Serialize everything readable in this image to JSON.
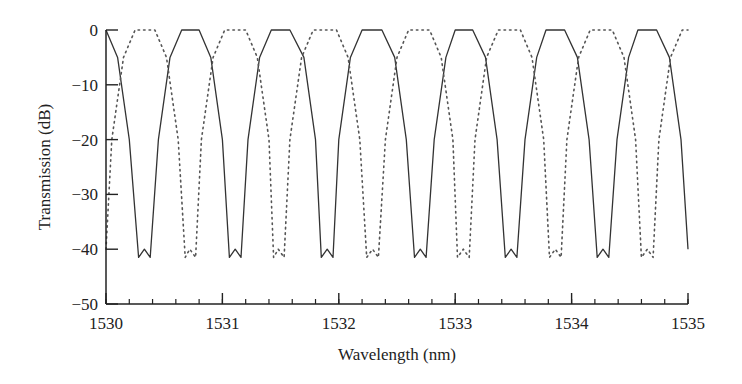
{
  "chart_data": {
    "type": "line",
    "title": "",
    "xlabel": "Wavelength (nm)",
    "ylabel": "Transmission (dB)",
    "xlim": [
      1530,
      1535
    ],
    "ylim": [
      -50,
      0
    ],
    "xticks": [
      1530,
      1531,
      1532,
      1533,
      1534,
      1535
    ],
    "xtick_labels": [
      "1530",
      "1531",
      "1532",
      "1533",
      "1534",
      "1535"
    ],
    "x_minor_step": 0.2,
    "yticks": [
      0,
      -10,
      -20,
      -30,
      -40,
      -50
    ],
    "ytick_labels": [
      "0",
      "−10",
      "−20",
      "−30",
      "−40",
      "−50"
    ],
    "grid": false,
    "legend": null,
    "period_nm": 0.785,
    "series": [
      {
        "name": "solid",
        "style": "solid",
        "color": "#333333",
        "peaks_nm": [
          1530.0,
          1530.73,
          1531.5,
          1532.29,
          1533.07,
          1533.86,
          1534.65
        ],
        "dips_nm": [
          1530.33,
          1531.11,
          1531.9,
          1532.7,
          1533.48,
          1534.27
        ],
        "peak_db": 0,
        "dip_db": -41.5,
        "points": [
          [
            1530.0,
            0
          ],
          [
            1530.1,
            -5
          ],
          [
            1530.2,
            -20
          ],
          [
            1530.28,
            -41.5
          ],
          [
            1530.33,
            -40
          ],
          [
            1530.38,
            -41.5
          ],
          [
            1530.45,
            -20
          ],
          [
            1530.55,
            -5
          ],
          [
            1530.65,
            0
          ],
          [
            1530.8,
            0
          ],
          [
            1530.9,
            -5
          ],
          [
            1531.0,
            -20
          ],
          [
            1531.06,
            -41.5
          ],
          [
            1531.11,
            -40
          ],
          [
            1531.16,
            -41.5
          ],
          [
            1531.22,
            -20
          ],
          [
            1531.32,
            -5
          ],
          [
            1531.42,
            0
          ],
          [
            1531.58,
            0
          ],
          [
            1531.7,
            -5
          ],
          [
            1531.8,
            -20
          ],
          [
            1531.85,
            -41.5
          ],
          [
            1531.9,
            -40
          ],
          [
            1531.95,
            -41.5
          ],
          [
            1532.0,
            -20
          ],
          [
            1532.1,
            -5
          ],
          [
            1532.2,
            0
          ],
          [
            1532.37,
            0
          ],
          [
            1532.48,
            -5
          ],
          [
            1532.58,
            -20
          ],
          [
            1532.65,
            -41.5
          ],
          [
            1532.7,
            -40
          ],
          [
            1532.75,
            -41.5
          ],
          [
            1532.82,
            -20
          ],
          [
            1532.92,
            -5
          ],
          [
            1533.0,
            0
          ],
          [
            1533.15,
            0
          ],
          [
            1533.26,
            -5
          ],
          [
            1533.36,
            -20
          ],
          [
            1533.43,
            -41.5
          ],
          [
            1533.48,
            -40
          ],
          [
            1533.53,
            -41.5
          ],
          [
            1533.6,
            -20
          ],
          [
            1533.7,
            -5
          ],
          [
            1533.78,
            0
          ],
          [
            1533.94,
            0
          ],
          [
            1534.05,
            -5
          ],
          [
            1534.15,
            -20
          ],
          [
            1534.22,
            -41.5
          ],
          [
            1534.27,
            -40
          ],
          [
            1534.32,
            -41.5
          ],
          [
            1534.39,
            -20
          ],
          [
            1534.49,
            -5
          ],
          [
            1534.57,
            0
          ],
          [
            1534.73,
            0
          ],
          [
            1534.84,
            -5
          ],
          [
            1534.94,
            -20
          ],
          [
            1535.0,
            -40
          ]
        ]
      },
      {
        "name": "dashed",
        "style": "dotted",
        "color": "#555555",
        "peaks_nm": [
          1530.33,
          1531.11,
          1531.9,
          1532.7,
          1533.48,
          1534.27
        ],
        "dips_nm": [
          1530.0,
          1530.71,
          1531.48,
          1532.29,
          1533.07,
          1533.86,
          1534.65
        ],
        "peak_db": 0,
        "dip_db": -41.5,
        "points": [
          [
            1530.0,
            -40
          ],
          [
            1530.05,
            -20
          ],
          [
            1530.15,
            -5
          ],
          [
            1530.25,
            0
          ],
          [
            1530.42,
            0
          ],
          [
            1530.52,
            -5
          ],
          [
            1530.62,
            -20
          ],
          [
            1530.68,
            -41.5
          ],
          [
            1530.72,
            -40
          ],
          [
            1530.77,
            -41.5
          ],
          [
            1530.82,
            -20
          ],
          [
            1530.92,
            -5
          ],
          [
            1531.02,
            0
          ],
          [
            1531.2,
            0
          ],
          [
            1531.3,
            -5
          ],
          [
            1531.4,
            -20
          ],
          [
            1531.44,
            -41.5
          ],
          [
            1531.48,
            -40
          ],
          [
            1531.53,
            -41.5
          ],
          [
            1531.58,
            -20
          ],
          [
            1531.68,
            -5
          ],
          [
            1531.78,
            0
          ],
          [
            1531.98,
            0
          ],
          [
            1532.08,
            -5
          ],
          [
            1532.18,
            -20
          ],
          [
            1532.24,
            -41.5
          ],
          [
            1532.29,
            -40
          ],
          [
            1532.34,
            -41.5
          ],
          [
            1532.4,
            -20
          ],
          [
            1532.5,
            -5
          ],
          [
            1532.6,
            0
          ],
          [
            1532.78,
            0
          ],
          [
            1532.88,
            -5
          ],
          [
            1532.98,
            -20
          ],
          [
            1533.02,
            -41.5
          ],
          [
            1533.07,
            -40
          ],
          [
            1533.12,
            -41.5
          ],
          [
            1533.17,
            -20
          ],
          [
            1533.27,
            -5
          ],
          [
            1533.37,
            0
          ],
          [
            1533.56,
            0
          ],
          [
            1533.66,
            -5
          ],
          [
            1533.76,
            -20
          ],
          [
            1533.81,
            -41.5
          ],
          [
            1533.86,
            -40
          ],
          [
            1533.91,
            -41.5
          ],
          [
            1533.96,
            -20
          ],
          [
            1534.06,
            -5
          ],
          [
            1534.16,
            0
          ],
          [
            1534.35,
            0
          ],
          [
            1534.45,
            -5
          ],
          [
            1534.55,
            -20
          ],
          [
            1534.6,
            -41.5
          ],
          [
            1534.65,
            -40
          ],
          [
            1534.7,
            -41.5
          ],
          [
            1534.75,
            -20
          ],
          [
            1534.85,
            -5
          ],
          [
            1534.95,
            0
          ],
          [
            1535.0,
            0
          ]
        ]
      }
    ],
    "plot_area_px": {
      "x0": 106,
      "x1": 688,
      "y_top": 30,
      "y_bottom": 304
    }
  }
}
